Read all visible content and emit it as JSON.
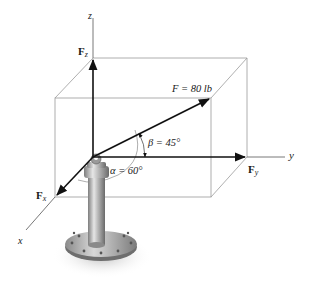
{
  "diagram": {
    "type": "3D force vector diagram",
    "axes": {
      "x_label": "x",
      "y_label": "y",
      "z_label": "z"
    },
    "force": {
      "symbol": "F",
      "magnitude_text": "F = 80 lb",
      "magnitude": 80,
      "unit": "lb"
    },
    "components": {
      "fx": {
        "symbol": "F",
        "subscript": "x"
      },
      "fy": {
        "symbol": "F",
        "subscript": "y"
      },
      "fz": {
        "symbol": "F",
        "subscript": "z"
      }
    },
    "angles": {
      "alpha_text": "α = 60°",
      "alpha": 60,
      "beta_text": "β = 45°",
      "beta": 45
    },
    "colors": {
      "vector": "#111111",
      "box_lines": "#9a9a9a",
      "axis_lines": "#555555",
      "post": "#a8a8a8"
    }
  }
}
